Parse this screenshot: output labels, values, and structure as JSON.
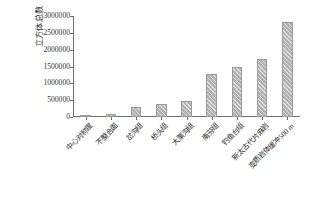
{
  "chart_data": {
    "type": "bar",
    "title": "",
    "xlabel": "",
    "ylabel": "立方体总数",
    "ylim": [
      0,
      3000000
    ],
    "grid": false,
    "legend": null,
    "ytick_labels": [
      "3000000",
      "2500000",
      "2000000",
      "1500000",
      "1000000",
      "500000",
      "0"
    ],
    "ytick_values": [
      3000000,
      2500000,
      2000000,
      1500000,
      1000000,
      500000,
      0
    ],
    "categories": [
      "中心对称度",
      "不整合面",
      "岔沟组",
      "桥头组",
      "大栗沟组",
      "南芬组",
      "钓鱼台组",
      "新太古代片麻岩",
      "变质岩体缓冲500 m"
    ],
    "values": [
      8000,
      75000,
      290000,
      390000,
      465000,
      1280000,
      1480000,
      1710000,
      2820000
    ],
    "bar_color": "#b2b2b2",
    "bar_pattern": "diagonal-hatch"
  }
}
